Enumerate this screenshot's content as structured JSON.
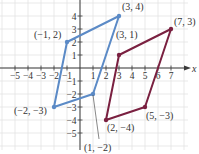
{
  "diagram": {
    "axes": {
      "x_label": "x",
      "x_ticks": [
        "−5",
        "−4",
        "−3",
        "−2",
        "−1",
        "1",
        "2",
        "3",
        "4",
        "5",
        "6",
        "7"
      ],
      "x_tick_values": [
        -5,
        -4,
        -3,
        -2,
        -1,
        1,
        2,
        3,
        4,
        5,
        6,
        7
      ],
      "y_ticks": [
        "4",
        "3",
        "2",
        "1",
        "−1",
        "−2",
        "−3",
        "−4",
        "−5"
      ],
      "y_tick_values": [
        4,
        3,
        2,
        1,
        -1,
        -2,
        -3,
        -4,
        -5
      ],
      "x_range": [
        -6,
        8
      ],
      "y_range": [
        -6,
        5
      ],
      "grid": true
    },
    "shapes": [
      {
        "name": "blue-parallelogram",
        "color": "#5b8ac6",
        "vertices": [
          [
            -1,
            2
          ],
          [
            3,
            4
          ],
          [
            1,
            -2
          ],
          [
            -2,
            -3
          ]
        ],
        "labels": [
          "(−1, 2)",
          "(3, 4)",
          "(1, −2)",
          "(−2, −3)"
        ]
      },
      {
        "name": "maroon-parallelogram",
        "color": "#7a2040",
        "vertices": [
          [
            3,
            1
          ],
          [
            7,
            3
          ],
          [
            5,
            -3
          ],
          [
            2,
            -4
          ]
        ],
        "labels": [
          "(3, 1)",
          "(7, 3)",
          "(5, −3)",
          "(2, −4)"
        ]
      }
    ]
  }
}
